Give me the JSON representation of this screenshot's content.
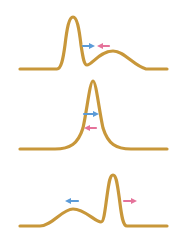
{
  "diagram": {
    "colors": {
      "curve": "#c8973a",
      "arrow_blue": "#5b9bd8",
      "arrow_pink": "#e5739b",
      "background": "#ffffff"
    },
    "panels": [
      {
        "id": "top",
        "shape": "sharp peak on left, broad hump on right",
        "arrows": [
          {
            "color": "blue",
            "direction": "right"
          },
          {
            "color": "pink",
            "direction": "left"
          }
        ]
      },
      {
        "id": "middle",
        "shape": "single merged sharp peak",
        "arrows": [
          {
            "color": "blue",
            "direction": "right"
          },
          {
            "color": "pink",
            "direction": "left"
          }
        ]
      },
      {
        "id": "bottom",
        "shape": "broad hump on left, sharp peak on right",
        "arrows": [
          {
            "color": "blue",
            "direction": "left"
          },
          {
            "color": "pink",
            "direction": "right"
          }
        ]
      }
    ]
  }
}
